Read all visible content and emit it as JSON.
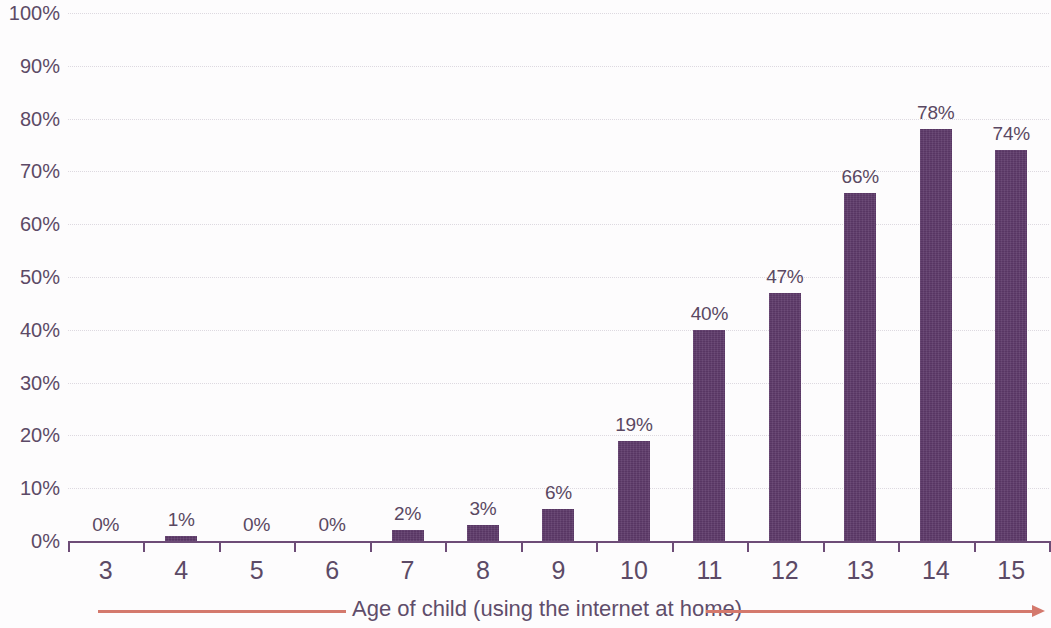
{
  "chart_data": {
    "type": "bar",
    "title": "",
    "subtitle": "",
    "xlabel": "Age of child (using the internet at home)",
    "ylabel": "",
    "categories": [
      "3",
      "4",
      "5",
      "6",
      "7",
      "8",
      "9",
      "10",
      "11",
      "12",
      "13",
      "14",
      "15"
    ],
    "values": [
      0,
      1,
      0,
      0,
      2,
      3,
      6,
      19,
      40,
      47,
      66,
      78,
      74
    ],
    "data_labels": [
      "0%",
      "1%",
      "0%",
      "0%",
      "2%",
      "3%",
      "6%",
      "19%",
      "40%",
      "47%",
      "66%",
      "78%",
      "74%"
    ],
    "ylim": [
      0,
      100
    ],
    "ytick_values": [
      0,
      10,
      20,
      30,
      40,
      50,
      60,
      70,
      80,
      90,
      100
    ],
    "ytick_labels": [
      "0%",
      "10%",
      "20%",
      "30%",
      "40%",
      "50%",
      "60%",
      "70%",
      "80%",
      "90%",
      "100%"
    ],
    "grid": true,
    "legend": "none",
    "series": [
      {
        "name": "Children using the internet at home",
        "values": [
          0,
          1,
          0,
          0,
          2,
          3,
          6,
          19,
          40,
          47,
          66,
          78,
          74
        ]
      }
    ],
    "colors": {
      "bar": "#5e3a6a",
      "axis": "#6d4c77",
      "grid": "#d8d4dc",
      "text": "#5c4a66",
      "arrow": "#d4796d",
      "background": "#fdfcfd"
    }
  }
}
